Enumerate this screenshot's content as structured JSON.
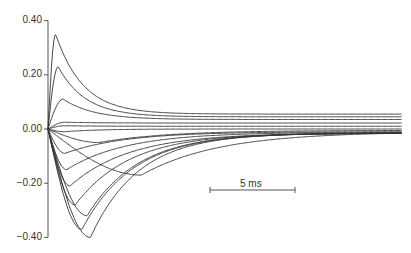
{
  "chart_data": {
    "type": "line",
    "title": "",
    "xlabel": "",
    "ylabel": "",
    "ylim": [
      -0.4,
      0.4
    ],
    "xlim_ms": [
      0,
      20.8
    ],
    "grid": false,
    "legend": null,
    "y_ticks": [
      "0.40",
      "0.20",
      "0.00",
      "−0.20",
      "−0.40"
    ],
    "y_tick_values": [
      0.4,
      0.2,
      0.0,
      -0.2,
      -0.4
    ],
    "scale_bar": {
      "label": "5 ms",
      "duration_ms": 5
    },
    "series": [
      {
        "name": "trace-1",
        "peak": 0.35,
        "peak_time_ms": 0.45,
        "steady": 0.055,
        "tau_ms": 1.6
      },
      {
        "name": "trace-2",
        "peak": 0.23,
        "peak_time_ms": 0.6,
        "steady": 0.045,
        "tau_ms": 1.6
      },
      {
        "name": "trace-3",
        "peak": 0.11,
        "peak_time_ms": 0.9,
        "steady": 0.035,
        "tau_ms": 1.8
      },
      {
        "name": "trace-4",
        "peak": 0.025,
        "peak_time_ms": 1.0,
        "steady": 0.022,
        "tau_ms": 2.0
      },
      {
        "name": "trace-5",
        "peak": 0.012,
        "peak_time_ms": 1.0,
        "steady": 0.01,
        "tau_ms": 2.0
      },
      {
        "name": "trace-6",
        "peak": -0.01,
        "peak_time_ms": 1.0,
        "steady": 0.0,
        "tau_ms": 2.0
      },
      {
        "name": "trace-7",
        "peak": -0.05,
        "peak_time_ms": 3.0,
        "steady": -0.005,
        "tau_ms": 4.0
      },
      {
        "name": "trace-8",
        "peak": -0.09,
        "peak_time_ms": 1.0,
        "steady": -0.01,
        "tau_ms": 3.5
      },
      {
        "name": "trace-9",
        "peak": -0.15,
        "peak_time_ms": 1.1,
        "steady": -0.012,
        "tau_ms": 3.5
      },
      {
        "name": "trace-10",
        "peak": -0.17,
        "peak_time_ms": 5.5,
        "steady": -0.01,
        "tau_ms": 4.5
      },
      {
        "name": "trace-11",
        "peak": -0.21,
        "peak_time_ms": 1.3,
        "steady": -0.015,
        "tau_ms": 3.5
      },
      {
        "name": "trace-12",
        "peak": -0.28,
        "peak_time_ms": 1.6,
        "steady": -0.015,
        "tau_ms": 3.2
      },
      {
        "name": "trace-13",
        "peak": -0.32,
        "peak_time_ms": 2.3,
        "steady": -0.015,
        "tau_ms": 3.0
      },
      {
        "name": "trace-14",
        "peak": -0.37,
        "peak_time_ms": 2.0,
        "steady": -0.015,
        "tau_ms": 3.0
      },
      {
        "name": "trace-15",
        "peak": -0.4,
        "peak_time_ms": 2.5,
        "steady": -0.015,
        "tau_ms": 2.8
      }
    ]
  }
}
